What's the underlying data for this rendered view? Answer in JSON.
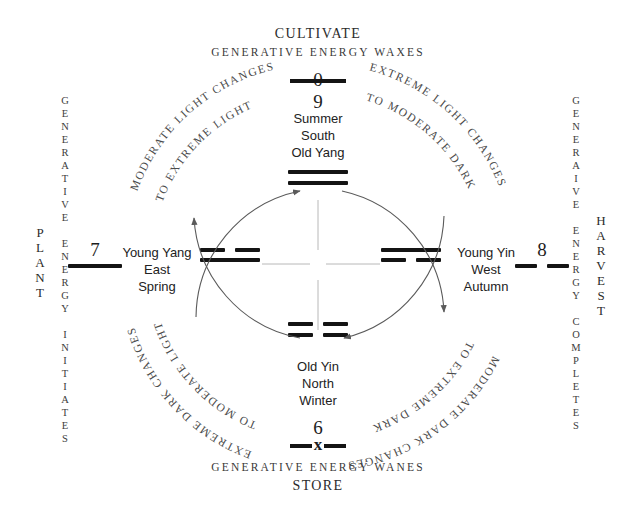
{
  "diagram": {
    "title_top": "CULTIVATE",
    "title_bottom": "STORE",
    "subtitle_top": "Generative Energy Waxes",
    "subtitle_bottom": "Generative Energy Wanes"
  },
  "left_side": {
    "outer_label": "PLANT",
    "inner_line1": "GENERATIVE",
    "inner_line2": "ENERGY",
    "inner_line3": "INITIATES",
    "numeral": "7",
    "line_type": "solid"
  },
  "right_side": {
    "outer_label": "HARVEST",
    "inner_line1": "GENERAIVE",
    "inner_line2": "ENERGY",
    "inner_line3": "COMPLETES",
    "numeral": "8",
    "line_type": "broken"
  },
  "top_numeral": {
    "value": "0",
    "below": "9",
    "style": "struck-through"
  },
  "bottom_numeral": {
    "value": "6",
    "below": "x",
    "style": "x-through"
  },
  "quadrants": [
    {
      "id": "summer",
      "name_line1": "Summer",
      "name_line2": "South",
      "name_line3": "Old Yang",
      "trigram": [
        "solid",
        "solid"
      ]
    },
    {
      "id": "autumn",
      "name_line1": "Young Yin",
      "name_line2": "West",
      "name_line3": "Autumn",
      "trigram": [
        "solid",
        "broken"
      ]
    },
    {
      "id": "winter",
      "name_line1": "Old Yin",
      "name_line2": "North",
      "name_line3": "Winter",
      "trigram": [
        "broken",
        "broken"
      ]
    },
    {
      "id": "spring",
      "name_line1": "Young Yang",
      "name_line2": "East",
      "name_line3": "Spring",
      "trigram": [
        "broken",
        "solid"
      ]
    }
  ],
  "arcs": [
    {
      "id": "arc-top-left",
      "line1": "MODERATE LIGHT CHANGES",
      "line2": "TO EXTREME LIGHT",
      "direction": "clockwise-up-right"
    },
    {
      "id": "arc-top-right",
      "line1": "EXTREME LIGHT CHANGES",
      "line2": "TO MODERATE DARK",
      "direction": "clockwise-down-right"
    },
    {
      "id": "arc-bottom-right",
      "line1": "MODERATE DARK CHANGES",
      "line2": "TO EXTREME DARK",
      "direction": "clockwise-down-left"
    },
    {
      "id": "arc-bottom-left",
      "line1": "EXTREME DARK CHANGES",
      "line2": "TO MODERATE LIGHT",
      "direction": "clockwise-up-left"
    }
  ],
  "colors": {
    "ink": "#141414",
    "arc": "#5a5a5a",
    "spoke": "#b8b8b8",
    "background": "#ffffff"
  }
}
